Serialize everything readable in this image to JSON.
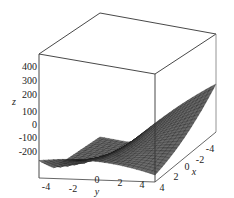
{
  "chart_data": {
    "type": "surface3d",
    "title": "",
    "xlabel": "x",
    "ylabel": "y",
    "zlabel": "z",
    "x_ticks": [
      "-4",
      "-2",
      "0",
      "2",
      "4"
    ],
    "y_ticks": [
      "-4",
      "-2",
      "0",
      "2",
      "4"
    ],
    "z_ticks": [
      "400",
      "300",
      "200",
      "100",
      "0",
      "-100",
      "-200"
    ],
    "xlim": [
      -5,
      5
    ],
    "ylim": [
      -5,
      5
    ],
    "zlim": [
      -250,
      450
    ],
    "surface_color": "#5a5a5a",
    "mesh_color": "#1a1a1a",
    "box": true,
    "grid_resolution": 25
  },
  "axes": {
    "z": {
      "label": "z",
      "ticks": [
        "400",
        "300",
        "200",
        "100",
        "0",
        "-100",
        "-200"
      ]
    },
    "y": {
      "label": "y",
      "ticks": [
        "-4",
        "-2",
        "0",
        "2",
        "4"
      ]
    },
    "x": {
      "label": "x",
      "ticks": [
        "4",
        "2",
        "0",
        "-2",
        "-4"
      ]
    }
  }
}
